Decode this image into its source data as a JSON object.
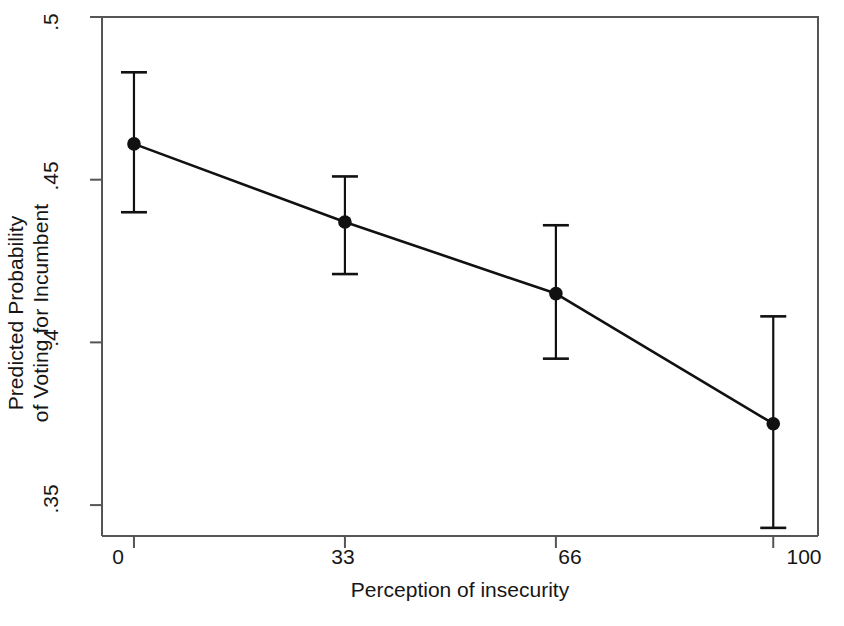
{
  "chart_data": {
    "type": "line",
    "title": "",
    "subtitle": "",
    "xlabel": "Perception of insecurity",
    "ylabel": "Predicted Probability of Voting for Incumbent",
    "ylabel_lines": [
      "Predicted Probability",
      "of Voting for Incumbent"
    ],
    "x": [
      0,
      33,
      66,
      100
    ],
    "xtick_labels": [
      "0",
      "33",
      "66",
      "100"
    ],
    "ytick_values": [
      0.5,
      0.45,
      0.4,
      0.35
    ],
    "ytick_labels": [
      ".5",
      ".45",
      ".4",
      ".35"
    ],
    "xlim": [
      -5,
      107
    ],
    "ylim": [
      0.3405,
      0.5
    ],
    "grid": false,
    "legend": null,
    "series": [
      {
        "name": "Predicted probability of voting for incumbent",
        "values": [
          0.461,
          0.437,
          0.415,
          0.375
        ],
        "ci_lower": [
          0.44,
          0.421,
          0.395,
          0.343
        ],
        "ci_upper": [
          0.483,
          0.451,
          0.436,
          0.408
        ],
        "marker": "filled-circle",
        "color": "#111111",
        "error_bars": true
      }
    ],
    "annotations": []
  },
  "figure": {
    "axis_color": "#555555",
    "line_color": "#111111",
    "marker_color": "#111111",
    "background": "#ffffff"
  }
}
